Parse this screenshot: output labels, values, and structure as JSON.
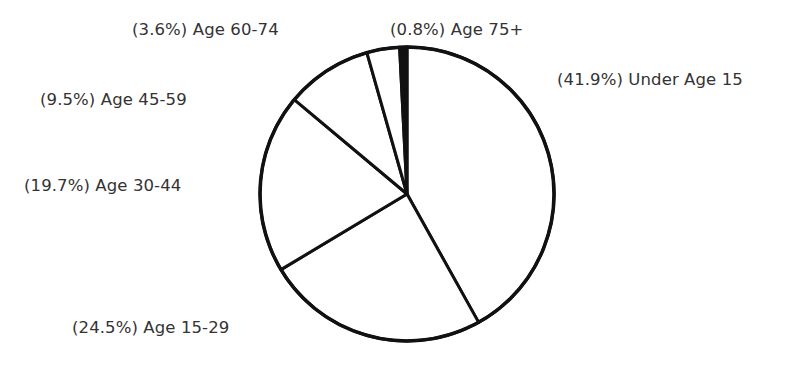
{
  "chart_data": {
    "type": "pie",
    "title": "",
    "start_angle": "top (12 o'clock)",
    "direction": "clockwise",
    "categories": [
      "Under Age 15",
      "Age 15-29",
      "Age 30-44",
      "Age 45-59",
      "Age 60-74",
      "Age 75+"
    ],
    "values": [
      41.9,
      24.5,
      19.7,
      9.5,
      3.6,
      0.8
    ],
    "unit": "%",
    "labels": [
      {
        "text": "(41.9%) Under Age 15",
        "x": 557,
        "y": 70
      },
      {
        "text": "(24.5%) Age 15-29",
        "x": 72,
        "y": 318
      },
      {
        "text": "(19.7%) Age 30-44",
        "x": 24,
        "y": 176
      },
      {
        "text": "(9.5%) Age 45-59",
        "x": 40,
        "y": 90
      },
      {
        "text": "(3.6%) Age 60-74",
        "x": 132,
        "y": 20
      },
      {
        "text": "(0.8%) Age 75+",
        "x": 390,
        "y": 20
      }
    ],
    "center": [
      407,
      194
    ],
    "radius": 147,
    "colors": {
      "fill": "#ffffff",
      "stroke": "#111111",
      "text": "#333333"
    },
    "legend": "none (inline labels)"
  }
}
